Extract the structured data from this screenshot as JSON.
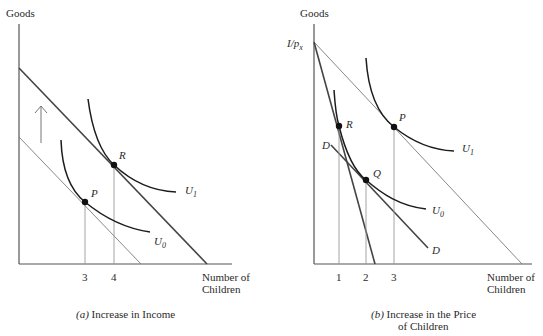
{
  "panel_a": {
    "y_axis_label": "Goods",
    "x_axis_label_line1": "Number of",
    "x_axis_label_line2": "Children",
    "ticks": [
      "3",
      "4"
    ],
    "points": {
      "P": "P",
      "R": "R"
    },
    "curves": {
      "U0": "U",
      "U0_sub": "0",
      "U1": "U",
      "U1_sub": "1"
    },
    "caption_prefix": "(a)",
    "caption": " Increase in Income"
  },
  "panel_b": {
    "y_axis_label": "Goods",
    "intercept_label": "I/p",
    "intercept_sub": "x",
    "x_axis_label_line1": "Number of",
    "x_axis_label_line2": "Children",
    "ticks": [
      "1",
      "2",
      "3"
    ],
    "points": {
      "P": "P",
      "R": "R",
      "Q": "Q"
    },
    "curves": {
      "U0": "U",
      "U0_sub": "0",
      "U1": "U",
      "U1_sub": "1"
    },
    "line_labels": {
      "D_top": "D",
      "D_bottom": "D"
    },
    "caption_prefix": "(b)",
    "caption_line1": " Increase in the Price",
    "caption_line2": "of Children"
  }
}
